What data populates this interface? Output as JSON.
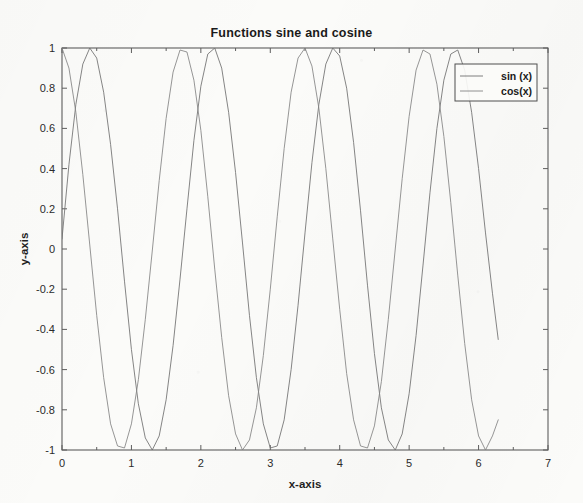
{
  "chart_data": {
    "type": "line",
    "title": "Functions sine and cosine",
    "xlabel": "x-axis",
    "ylabel": "y-axis",
    "xlim": [
      0,
      7
    ],
    "ylim": [
      -1,
      1
    ],
    "grid": false,
    "legend_position": "top-right",
    "xticks": [
      "0",
      "1",
      "2",
      "3",
      "4",
      "5",
      "6",
      "7"
    ],
    "xtick_values": [
      0,
      1,
      2,
      3,
      4,
      5,
      6,
      7
    ],
    "yticks": [
      "-1",
      "-0.8",
      "-0.6",
      "-0.4",
      "-0.2",
      "0",
      "0.2",
      "0.4",
      "0.6",
      "0.8",
      "1"
    ],
    "ytick_values": [
      -1,
      -0.8,
      -0.6,
      -0.4,
      -0.2,
      0,
      0.2,
      0.4,
      0.6,
      0.8,
      1
    ],
    "x_domain_start": 0,
    "x_domain_end": 6.2832,
    "series": [
      {
        "name": "sin (x)",
        "color": "#6f6f6f",
        "x": [
          0.0,
          0.1,
          0.2,
          0.3,
          0.4,
          0.5,
          0.6,
          0.7,
          0.8,
          0.9,
          1.0,
          1.1,
          1.2,
          1.3,
          1.4,
          1.5,
          1.6,
          1.7,
          1.8,
          1.9,
          2.0,
          2.1,
          2.2,
          2.3,
          2.4,
          2.5,
          2.6,
          2.7,
          2.8,
          2.9,
          3.0,
          3.1,
          3.2,
          3.3,
          3.4,
          3.5,
          3.6,
          3.7,
          3.8,
          3.9,
          4.0,
          4.1,
          4.2,
          4.3,
          4.4,
          4.5,
          4.6,
          4.7,
          4.8,
          4.9,
          5.0,
          5.1,
          5.2,
          5.3,
          5.4,
          5.5,
          5.6,
          5.7,
          5.8,
          5.9,
          6.0,
          6.1,
          6.2,
          6.2832
        ],
        "y": [
          0.05,
          0.42,
          0.72,
          0.92,
          1.0,
          0.95,
          0.78,
          0.52,
          0.2,
          -0.16,
          -0.5,
          -0.77,
          -0.94,
          -1.0,
          -0.93,
          -0.75,
          -0.48,
          -0.15,
          0.2,
          0.54,
          0.81,
          0.97,
          1.0,
          0.9,
          0.68,
          0.38,
          0.03,
          -0.33,
          -0.64,
          -0.87,
          -0.99,
          -0.98,
          -0.85,
          -0.6,
          -0.28,
          0.08,
          0.43,
          0.72,
          0.92,
          1.0,
          0.96,
          0.8,
          0.53,
          0.19,
          -0.18,
          -0.52,
          -0.79,
          -0.95,
          -1.0,
          -0.92,
          -0.72,
          -0.43,
          -0.08,
          0.28,
          0.6,
          0.84,
          0.97,
          0.99,
          0.89,
          0.68,
          0.4,
          0.08,
          -0.22,
          -0.45
        ]
      },
      {
        "name": "cos(x)",
        "color": "#838383",
        "x": [
          0.0,
          0.1,
          0.2,
          0.3,
          0.4,
          0.5,
          0.6,
          0.7,
          0.8,
          0.9,
          1.0,
          1.1,
          1.2,
          1.3,
          1.4,
          1.5,
          1.6,
          1.7,
          1.8,
          1.9,
          2.0,
          2.1,
          2.2,
          2.3,
          2.4,
          2.5,
          2.6,
          2.7,
          2.8,
          2.9,
          3.0,
          3.1,
          3.2,
          3.3,
          3.4,
          3.5,
          3.6,
          3.7,
          3.8,
          3.9,
          4.0,
          4.1,
          4.2,
          4.3,
          4.4,
          4.5,
          4.6,
          4.7,
          4.8,
          4.9,
          5.0,
          5.1,
          5.2,
          5.3,
          5.4,
          5.5,
          5.6,
          5.7,
          5.8,
          5.9,
          6.0,
          6.1,
          6.2,
          6.2832
        ],
        "y": [
          1.0,
          0.9,
          0.68,
          0.37,
          0.02,
          -0.33,
          -0.64,
          -0.87,
          -0.98,
          -0.99,
          -0.87,
          -0.65,
          -0.35,
          -0.01,
          0.34,
          0.65,
          0.88,
          0.99,
          0.98,
          0.84,
          0.59,
          0.26,
          -0.1,
          -0.44,
          -0.73,
          -0.92,
          -1.0,
          -0.95,
          -0.79,
          -0.53,
          -0.2,
          0.16,
          0.5,
          0.78,
          0.95,
          1.0,
          0.91,
          0.7,
          0.4,
          0.05,
          -0.3,
          -0.62,
          -0.85,
          -0.98,
          -0.99,
          -0.88,
          -0.66,
          -0.35,
          0.0,
          0.35,
          0.66,
          0.89,
          0.99,
          0.97,
          0.82,
          0.56,
          0.23,
          -0.13,
          -0.47,
          -0.75,
          -0.93,
          -1.0,
          -0.93,
          -0.85
        ]
      }
    ]
  },
  "legend": {
    "entries": [
      {
        "label": "sin (x)"
      },
      {
        "label": "cos(x)"
      }
    ]
  },
  "axes": {
    "x_title": "x-axis",
    "y_title": "y-axis"
  }
}
